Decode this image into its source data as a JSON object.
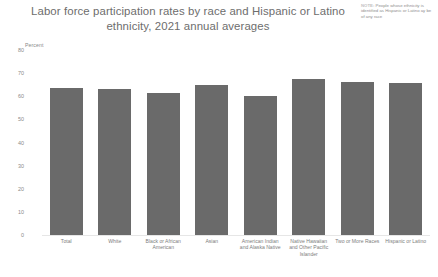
{
  "note": {
    "label": "NOTE:",
    "text": " People whose ethnicity is identified as Hispanic or Latino ay be of any race"
  },
  "axis_unit": "Percent",
  "chart_data": {
    "type": "bar",
    "title": "Labor force participation rates by race and Hispanic or Latino ethnicity, 2021 annual averages",
    "xlabel": "",
    "ylabel": "Percent",
    "ylim": [
      0,
      80
    ],
    "ytick_labels": [
      "80",
      "70",
      "60",
      "50",
      "40",
      "30",
      "20",
      "10",
      "0"
    ],
    "ytick_values": [
      80,
      70,
      60,
      50,
      40,
      30,
      20,
      10,
      0
    ],
    "grid": false,
    "legend": "none",
    "bar_color": "#6a6a6a",
    "categories": [
      "Total",
      "White",
      "Black or African American",
      "Asian",
      "American Indian and Alaska Native",
      "Native Hawaiian and Other Pacific Islander",
      "Two or More Races",
      "Hispanic or Latino"
    ],
    "values": [
      63.5,
      63.3,
      61.4,
      65.0,
      60.3,
      67.4,
      66.3,
      65.6
    ]
  }
}
